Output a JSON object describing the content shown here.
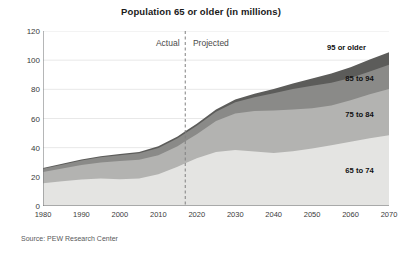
{
  "chart_data": {
    "type": "area",
    "title": "Population 65 or older (in millions)",
    "subtitle": "",
    "xlabel": "",
    "ylabel": "",
    "source": "Source: PEW Research Center",
    "stacked": true,
    "grid": true,
    "legend_position": "inline-band-labels",
    "xlim": [
      1980,
      2070
    ],
    "ylim": [
      0,
      120
    ],
    "x_ticks": [
      1980,
      1990,
      2000,
      2010,
      2020,
      2030,
      2040,
      2050,
      2060,
      2070
    ],
    "y_ticks": [
      0,
      20,
      40,
      60,
      80,
      100,
      120
    ],
    "x": [
      1980,
      1985,
      1990,
      1995,
      2000,
      2005,
      2010,
      2015,
      2017,
      2020,
      2025,
      2030,
      2035,
      2040,
      2045,
      2050,
      2055,
      2060,
      2065,
      2070
    ],
    "series": [
      {
        "name": "65 to 74",
        "color": "#e4e4e2",
        "values": [
          15.6,
          16.9,
          18.1,
          18.8,
          18.4,
          18.8,
          21.7,
          27.0,
          29.4,
          32.8,
          37.0,
          38.4,
          37.3,
          36.3,
          37.5,
          39.5,
          41.7,
          44.0,
          46.4,
          48.6
        ]
      },
      {
        "name": "75 to 84",
        "color": "#b3b3b1",
        "values": [
          7.7,
          8.8,
          10.1,
          11.1,
          12.4,
          12.9,
          13.1,
          14.0,
          15.0,
          16.4,
          21.3,
          25.0,
          27.8,
          29.2,
          28.6,
          27.6,
          27.2,
          28.5,
          30.2,
          31.6
        ]
      },
      {
        "name": "85 to 94",
        "color": "#8a8a88",
        "values": [
          2.2,
          2.6,
          3.0,
          3.5,
          4.0,
          4.4,
          5.0,
          5.4,
          5.5,
          5.8,
          6.3,
          7.7,
          9.5,
          11.9,
          14.1,
          15.4,
          15.6,
          15.3,
          15.6,
          16.7
        ]
      },
      {
        "name": "95 or older",
        "color": "#5c5c5a",
        "values": [
          0.5,
          0.6,
          0.7,
          0.8,
          0.9,
          1.0,
          1.1,
          1.2,
          1.3,
          1.4,
          1.6,
          1.9,
          2.3,
          2.9,
          3.8,
          5.0,
          6.3,
          7.4,
          8.2,
          8.6
        ]
      }
    ],
    "totals": [
      26.0,
      28.9,
      31.9,
      34.2,
      35.7,
      37.1,
      40.9,
      47.6,
      51.2,
      56.4,
      66.2,
      73.0,
      76.9,
      80.3,
      84.0,
      87.5,
      90.8,
      95.2,
      100.4,
      105.5
    ],
    "annotations": [
      {
        "name": "divider",
        "type": "vline",
        "x": 2017,
        "style": "dashed",
        "color": "#808080"
      },
      {
        "name": "actual",
        "text": "Actual",
        "x": 2015,
        "y": 112
      },
      {
        "name": "projected",
        "text": "Projected",
        "x": 2019,
        "y": 112
      }
    ],
    "band_labels": [
      {
        "text": "95 or older",
        "x": 2064,
        "y": 109
      },
      {
        "text": "85 to 94",
        "x": 2066,
        "y": 88
      },
      {
        "text": "75 to 84",
        "x": 2066,
        "y": 63
      },
      {
        "text": "65 to 74",
        "x": 2066,
        "y": 25
      }
    ]
  }
}
